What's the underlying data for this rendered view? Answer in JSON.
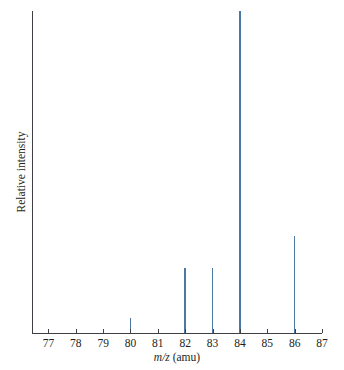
{
  "figure": {
    "xlabel_italic": "m/z",
    "xlabel_rest": " (amu)",
    "ylabel": "Relative intensity",
    "top_remnant": ""
  },
  "chart_data": {
    "type": "bar",
    "title": "",
    "subtitle": "",
    "xlabel": "m/z (amu)",
    "ylabel": "Relative intensity",
    "xlim": [
      76.4,
      87.0
    ],
    "ylim": [
      0,
      100
    ],
    "grid": false,
    "legend": null,
    "bar_color": "#4a79a4",
    "axis_color": "#3f3f46",
    "categories": [
      77,
      78,
      79,
      80,
      81,
      82,
      83,
      84,
      85,
      86,
      87
    ],
    "x_tick_labels": [
      "77",
      "78",
      "79",
      "80",
      "81",
      "82",
      "83",
      "84",
      "85",
      "86",
      "87"
    ],
    "y_tick_labels": [],
    "peaks": [
      {
        "mz": 80,
        "intensity": 4.7
      },
      {
        "mz": 82,
        "intensity": 20.2
      },
      {
        "mz": 83,
        "intensity": 20.2
      },
      {
        "mz": 84,
        "intensity": 100.0
      },
      {
        "mz": 86,
        "intensity": 30.1
      }
    ],
    "values": [
      0,
      0,
      0,
      4.7,
      0,
      20.2,
      20.2,
      100.0,
      0,
      30.1,
      0
    ]
  }
}
